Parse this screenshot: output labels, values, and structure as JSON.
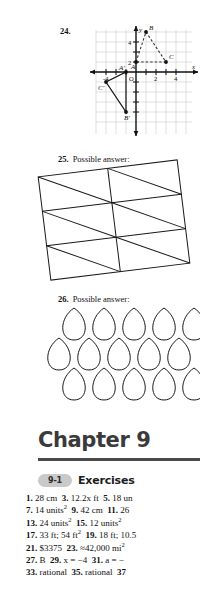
{
  "page": {
    "kind": "textbook-answer-key-page",
    "background": "#ffffff"
  },
  "problems": [
    {
      "number": "24.",
      "caption": "",
      "figure": {
        "type": "coordinate-plane",
        "axis_labels": {
          "x": "x",
          "y": "y"
        },
        "x_ticks": [
          "-4",
          "2",
          "4"
        ],
        "y_ticks": [
          "4",
          "2"
        ],
        "origin_label": "O",
        "x_range": [
          -5,
          5
        ],
        "y_range": [
          -5,
          5
        ],
        "grid": true,
        "shapes": [
          {
            "name": "preimage-triangle",
            "style": "dashed",
            "vertices": [
              {
                "label": "A",
                "x": 0,
                "y": 1
              },
              {
                "label": "B",
                "x": 1,
                "y": 4
              },
              {
                "label": "C",
                "x": 3,
                "y": 1
              }
            ]
          },
          {
            "name": "image-triangle",
            "style": "solid",
            "vertices": [
              {
                "label": "A'",
                "x": -1,
                "y": 0
              },
              {
                "label": "B'",
                "x": -1,
                "y": -4
              },
              {
                "label": "C'",
                "x": -3,
                "y": -1
              }
            ]
          }
        ]
      }
    },
    {
      "number": "25.",
      "caption": "Possible answer:",
      "figure": {
        "type": "tilted-triangulated-grid",
        "rows": 3,
        "cols": 2,
        "description": "tilted rectangle divided into rectangles each cut by a diagonal"
      }
    },
    {
      "number": "26.",
      "caption": "Possible answer:",
      "figure": {
        "type": "fish-scale-tessellation",
        "rows": 3,
        "cols": 5,
        "description": "overlapping scale / petal shapes tiling the plane"
      }
    }
  ],
  "chapter": {
    "title": "Chapter 9",
    "rule_color": "#4a4a4a"
  },
  "lesson": {
    "badge": "9-1",
    "title": "Exercises",
    "answer_lines": [
      [
        {
          "num": "1.",
          "ans": "28 cm"
        },
        {
          "num": "3.",
          "ans": "12.2x ft"
        },
        {
          "num": "5.",
          "ans": "18 un"
        }
      ],
      [
        {
          "num": "7.",
          "ans": "14 units",
          "sup": "2"
        },
        {
          "num": "9.",
          "ans": "42 cm"
        },
        {
          "num": "11.",
          "ans": "26"
        }
      ],
      [
        {
          "num": "13.",
          "ans": "24 units",
          "sup": "2"
        },
        {
          "num": "15.",
          "ans": "12 units",
          "sup": "2"
        }
      ],
      [
        {
          "num": "17.",
          "ans": "33 ft; 54 ft",
          "sup": "2"
        },
        {
          "num": "19.",
          "ans": "18 ft; 10.5"
        }
      ],
      [
        {
          "num": "21.",
          "ans": "$3375"
        },
        {
          "num": "23.",
          "ans": "≈42,000 mi",
          "sup": "2"
        }
      ],
      [
        {
          "num": "27.",
          "ans": "B"
        },
        {
          "num": "29.",
          "ans": "x = −4"
        },
        {
          "num": "31.",
          "ans": "a = −"
        }
      ],
      [
        {
          "num": "33.",
          "ans": "rational"
        },
        {
          "num": "35.",
          "ans": "rational"
        },
        {
          "num": "37",
          "ans": ""
        }
      ]
    ]
  }
}
